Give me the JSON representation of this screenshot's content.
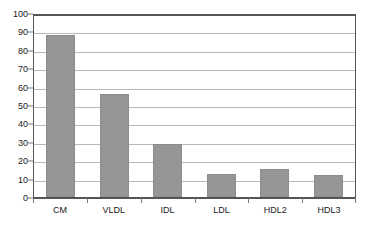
{
  "chart_data": {
    "type": "bar",
    "title": "",
    "xlabel": "",
    "ylabel": "",
    "categories": [
      "CM",
      "VLDL",
      "IDL",
      "LDL",
      "HDL2",
      "HDL3"
    ],
    "values": [
      88,
      56,
      29,
      12.5,
      15,
      12
    ],
    "ylim": [
      0,
      100
    ],
    "y_ticks": [
      0,
      10,
      20,
      30,
      40,
      50,
      60,
      70,
      80,
      90,
      100
    ],
    "y_tick_labels": [
      "0",
      "10",
      "20",
      "30",
      "40",
      "50",
      "60",
      "70",
      "80",
      "90",
      "100"
    ],
    "grid": true,
    "legend": false,
    "legend_position": "none",
    "colors": {
      "bar_fill": "#969696",
      "bar_border": "#8c8c8c",
      "gridline": "#b9b9b9",
      "axis": "#555555",
      "tick_mark": "#7a7a7a",
      "background": "#ffffff",
      "text": "#1a1a1a"
    }
  }
}
